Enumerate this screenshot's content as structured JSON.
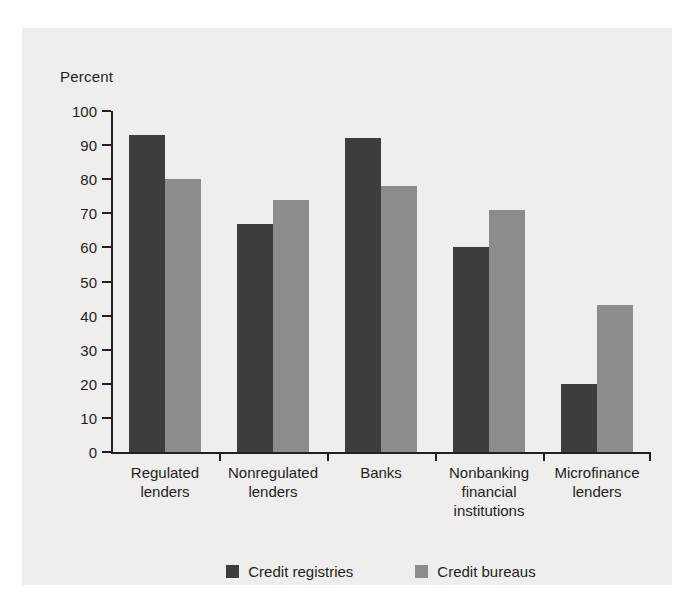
{
  "chart_data": {
    "type": "bar",
    "title": "",
    "ylabel": "Percent",
    "xlabel": "",
    "ylim": [
      0,
      100
    ],
    "yticks": [
      0,
      10,
      20,
      30,
      40,
      50,
      60,
      70,
      80,
      90,
      100
    ],
    "ytick_labels": [
      "0",
      "10",
      "20",
      "30",
      "40",
      "50",
      "60",
      "70",
      "80",
      "90",
      "100"
    ],
    "grid": false,
    "legend_position": "bottom-center",
    "categories": [
      "Regulated lenders",
      "Nonregulated lenders",
      "Banks",
      "Nonbanking financial institutions",
      "Microfinance lenders"
    ],
    "category_lines": [
      [
        "Regulated",
        "lenders"
      ],
      [
        "Nonregulated",
        "lenders"
      ],
      [
        "Banks"
      ],
      [
        "Nonbanking",
        "financial",
        "institutions"
      ],
      [
        "Microfinance",
        "lenders"
      ]
    ],
    "series": [
      {
        "name": "Credit registries",
        "color": "#3d3d3d",
        "values": [
          93,
          67,
          92,
          60,
          20
        ]
      },
      {
        "name": "Credit bureaus",
        "color": "#8c8c8c",
        "values": [
          80,
          74,
          78,
          71,
          43
        ]
      }
    ]
  },
  "colors": {
    "background": "#eeeeec",
    "page": "#ffffff",
    "axis": "#231f20",
    "text": "#231f20",
    "credit_registries": "#3d3d3d",
    "credit_bureaus": "#8c8c8c"
  }
}
